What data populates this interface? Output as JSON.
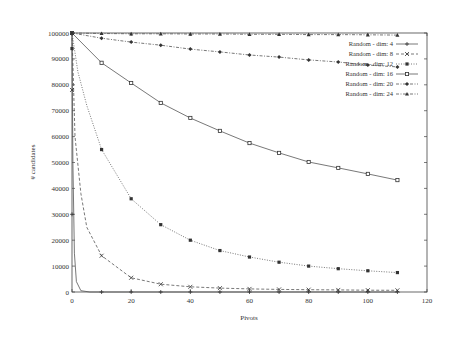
{
  "chart_data": {
    "type": "line",
    "title": "",
    "xlabel": "Pivots",
    "ylabel": "# candidates",
    "xlim": [
      0,
      120
    ],
    "ylim": [
      0,
      100000
    ],
    "xticks": [
      0,
      20,
      40,
      60,
      80,
      100,
      120
    ],
    "yticks": [
      0,
      10000,
      20000,
      30000,
      40000,
      50000,
      60000,
      70000,
      80000,
      90000,
      100000
    ],
    "grid": false,
    "legend_position": "upper right, inside",
    "x": [
      0,
      10,
      20,
      30,
      40,
      50,
      60,
      70,
      80,
      90,
      100,
      110
    ],
    "series": [
      {
        "name": "Random - dim: 4",
        "marker": "plus",
        "dash": "solid",
        "values": [
          30000,
          0,
          0,
          0,
          0,
          0,
          0,
          0,
          0,
          0,
          0,
          0
        ]
      },
      {
        "name": "Random - dim: 8",
        "marker": "x",
        "dash": "dashed",
        "values": [
          78000,
          14000,
          5500,
          3000,
          2000,
          1500,
          1200,
          1000,
          900,
          800,
          700,
          650
        ]
      },
      {
        "name": "Random - dim: 12",
        "marker": "filled-square",
        "dash": "dotted",
        "values": [
          94000,
          55000,
          36000,
          26000,
          20000,
          16000,
          13500,
          11500,
          10000,
          9000,
          8200,
          7500
        ]
      },
      {
        "name": "Random - dim: 16",
        "marker": "open-square",
        "dash": "solid",
        "values": [
          100000,
          88500,
          80700,
          73000,
          67200,
          62200,
          57500,
          53700,
          50200,
          47900,
          45600,
          43200
        ]
      },
      {
        "name": "Random - dim: 20",
        "marker": "diamond",
        "dash": "dash-dot",
        "values": [
          100000,
          98000,
          96500,
          95300,
          93800,
          92700,
          91500,
          90700,
          89600,
          88800,
          87600,
          86900
        ]
      },
      {
        "name": "Random - dim: 24",
        "marker": "triangle",
        "dash": "dash-dot",
        "values": [
          100000,
          99800,
          99700,
          99700,
          99600,
          99600,
          99500,
          99500,
          99400,
          99400,
          99300,
          99200
        ]
      }
    ]
  }
}
